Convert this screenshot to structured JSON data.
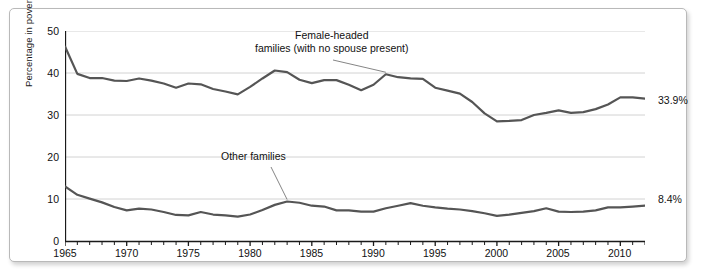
{
  "chart_data": {
    "type": "line",
    "title": "",
    "xlabel": "",
    "ylabel": "Percentage in poverty",
    "ylim": [
      0,
      50
    ],
    "xlim": [
      1965,
      2012
    ],
    "yticks": [
      0,
      10,
      20,
      30,
      40,
      50
    ],
    "xticks": [
      1965,
      1970,
      1975,
      1980,
      1985,
      1990,
      1995,
      2000,
      2005,
      2010
    ],
    "grid": "horizontal",
    "legend_position": "inline-annotations",
    "line_color": "#555555",
    "grid_color": "#d2d2d2",
    "axis_color": "#1a1a1a",
    "x": [
      1965,
      1966,
      1967,
      1968,
      1969,
      1970,
      1971,
      1972,
      1973,
      1974,
      1975,
      1976,
      1977,
      1978,
      1979,
      1980,
      1981,
      1982,
      1983,
      1984,
      1985,
      1986,
      1987,
      1988,
      1989,
      1990,
      1991,
      1992,
      1993,
      1994,
      1995,
      1996,
      1997,
      1998,
      1999,
      2000,
      2001,
      2002,
      2003,
      2004,
      2005,
      2006,
      2007,
      2008,
      2009,
      2010,
      2011,
      2012
    ],
    "series": [
      {
        "name": "Female-headed families (with no spouse present)",
        "values": [
          46.3,
          39.8,
          38.8,
          38.8,
          38.2,
          38.1,
          38.7,
          38.2,
          37.5,
          36.5,
          37.5,
          37.3,
          36.2,
          35.6,
          34.9,
          36.7,
          38.7,
          40.6,
          40.2,
          38.4,
          37.6,
          38.3,
          38.3,
          37.2,
          35.9,
          37.2,
          39.7,
          39.0,
          38.7,
          38.6,
          36.5,
          35.8,
          35.1,
          33.1,
          30.4,
          28.5,
          28.6,
          28.8,
          30.0,
          30.5,
          31.1,
          30.5,
          30.7,
          31.4,
          32.5,
          34.2,
          34.2,
          33.9
        ],
        "end_label": "33.9%"
      },
      {
        "name": "Other families",
        "values": [
          13.0,
          11.0,
          10.1,
          9.2,
          8.1,
          7.3,
          7.7,
          7.5,
          6.9,
          6.2,
          6.1,
          6.9,
          6.3,
          6.1,
          5.8,
          6.3,
          7.4,
          8.6,
          9.4,
          9.1,
          8.4,
          8.2,
          7.3,
          7.3,
          7.0,
          7.0,
          7.8,
          8.4,
          9.0,
          8.4,
          8.0,
          7.7,
          7.5,
          7.1,
          6.6,
          6.0,
          6.3,
          6.7,
          7.1,
          7.8,
          7.0,
          6.9,
          7.0,
          7.3,
          8.0,
          8.0,
          8.2,
          8.4
        ],
        "end_label": "8.4%"
      }
    ],
    "annotations": [
      {
        "id": "female-headed-annotation",
        "line1": "Female-headed",
        "line2": "families (with no spouse present)",
        "target_year": 1991,
        "target_value": 39.7
      },
      {
        "id": "other-families-annotation",
        "line1": "Other families",
        "line2": "",
        "target_year": 1983,
        "target_value": 9.4
      }
    ],
    "end_labels": [
      {
        "text": "33.9%",
        "series": "Female-headed families (with no spouse present)"
      },
      {
        "text": "8.4%",
        "series": "Other families"
      }
    ]
  }
}
